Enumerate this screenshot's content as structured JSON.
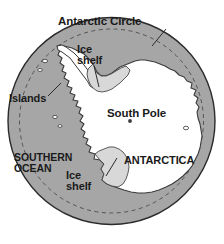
{
  "map": {
    "title": "Antarctica polar projection map",
    "labels": {
      "antarctic_circle": "Antarctic Circle",
      "ice_shelf_north": "Ice\nshelf",
      "islands": "Islands",
      "south_pole": "South Pole",
      "southern_ocean": "SOUTHERN\nOCEAN",
      "antarctica": "ANTARCTICA",
      "ice_shelf_south": "Ice\nshelf"
    },
    "colors": {
      "ocean": "#a6a6a6",
      "land": "#ffffff",
      "ice_shelf": "#d8d8d8",
      "outline": "#2b2b2b",
      "background": "#ffffff",
      "text": "#1a1a1a",
      "dashed_line": "#4d4d4d"
    },
    "features": [
      {
        "name": "southern-ocean",
        "type": "water",
        "fill": "#a6a6a6"
      },
      {
        "name": "antarctica-landmass",
        "type": "land",
        "fill": "#ffffff"
      },
      {
        "name": "ronne-filchner-ice-shelf",
        "type": "ice-shelf",
        "fill": "#d8d8d8"
      },
      {
        "name": "ross-ice-shelf",
        "type": "ice-shelf",
        "fill": "#d8d8d8"
      },
      {
        "name": "antarctic-circle-line",
        "type": "graticule",
        "style": "dashed"
      },
      {
        "name": "south-pole-marker",
        "type": "point"
      }
    ]
  }
}
